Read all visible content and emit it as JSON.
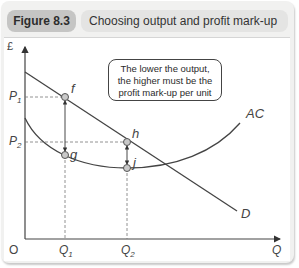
{
  "figure": {
    "number": "Figure 8.3",
    "title": "Choosing output and profit mark-up"
  },
  "callout": {
    "line1": "The lower the output,",
    "line2": "the higher must be the",
    "line3": "profit mark-up per unit"
  },
  "axes": {
    "y_label": "£",
    "x_label": "Q",
    "origin": "O",
    "y_ticks": [
      "P1",
      "P2"
    ],
    "x_ticks": [
      "Q1",
      "Q2"
    ]
  },
  "curves": {
    "demand": "D",
    "average_cost": "AC"
  },
  "points": {
    "f": "f",
    "g": "g",
    "h": "h",
    "j": "j"
  },
  "colors": {
    "frame_bg": "#f1f1f0",
    "badge_bg": "#c5c5c4",
    "title_bg": "#e4e4e3",
    "line": "#444444",
    "point_fill": "#c9c9c9"
  }
}
